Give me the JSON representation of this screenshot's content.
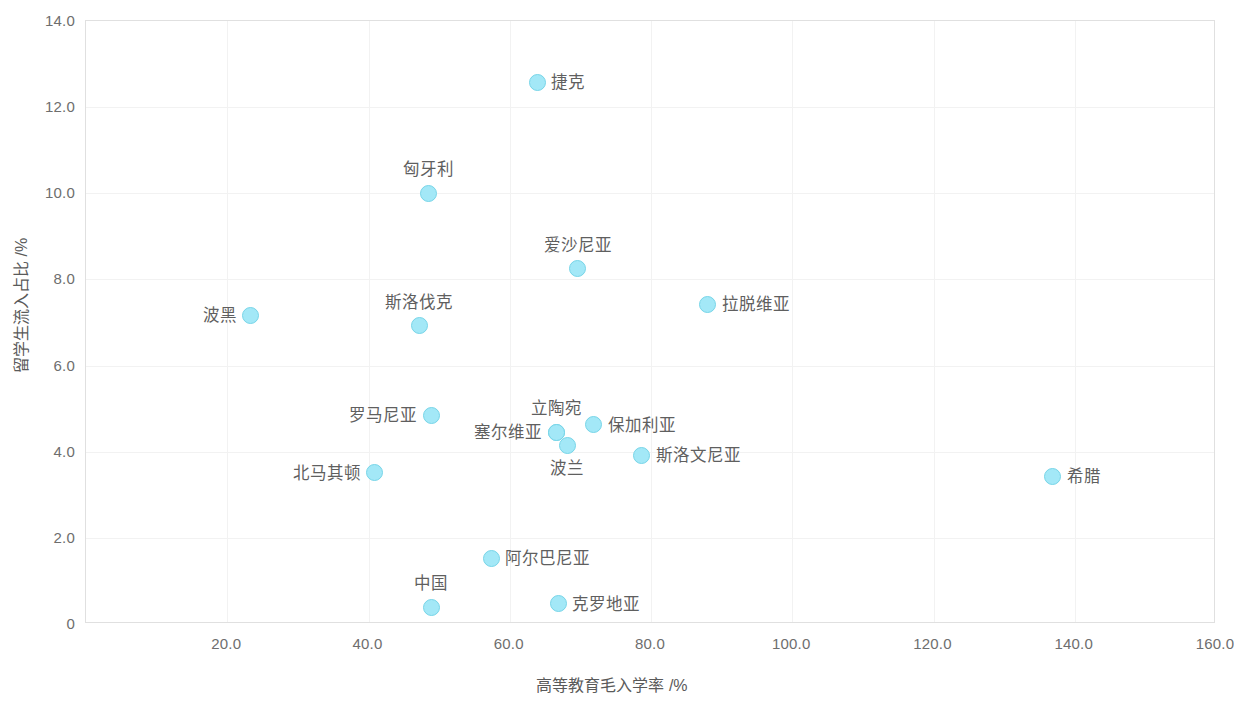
{
  "chart_data": {
    "type": "scatter",
    "title": "",
    "xlabel": "高等教育毛入学率 /%",
    "ylabel": "留学生流入占比 /%",
    "xlim": [
      0,
      160
    ],
    "ylim": [
      0,
      14
    ],
    "xticks": [
      "20.0",
      "40.0",
      "60.0",
      "80.0",
      "100.0",
      "120.0",
      "140.0",
      "160.0"
    ],
    "xtick_values": [
      20,
      40,
      60,
      80,
      100,
      120,
      140,
      160
    ],
    "yticks": [
      "0",
      "2.0",
      "4.0",
      "6.0",
      "8.0",
      "10.0",
      "12.0",
      "14.0"
    ],
    "ytick_values": [
      0,
      2,
      4,
      6,
      8,
      10,
      12,
      14
    ],
    "grid": true,
    "legend": "none",
    "marker_color": "#a3e8f7",
    "marker_edge_color": "#77d5e8",
    "points": [
      {
        "label": "捷克",
        "x": 64.0,
        "y": 12.55,
        "label_pos": "right"
      },
      {
        "label": "匈牙利",
        "x": 48.7,
        "y": 9.98,
        "label_pos": "above"
      },
      {
        "label": "爱沙尼亚",
        "x": 69.8,
        "y": 8.22,
        "label_pos": "above"
      },
      {
        "label": "拉脱维亚",
        "x": 88.2,
        "y": 7.4,
        "label_pos": "right"
      },
      {
        "label": "波黑",
        "x": 23.5,
        "y": 7.14,
        "label_pos": "left"
      },
      {
        "label": "斯洛伐克",
        "x": 47.3,
        "y": 6.9,
        "label_pos": "above"
      },
      {
        "label": "罗马尼亚",
        "x": 49.0,
        "y": 4.82,
        "label_pos": "left"
      },
      {
        "label": "立陶宛",
        "x": 66.7,
        "y": 4.43,
        "label_pos": "above"
      },
      {
        "label": "保加利亚",
        "x": 72.0,
        "y": 4.6,
        "label_pos": "right"
      },
      {
        "label": "波兰",
        "x": 68.3,
        "y": 4.12,
        "label_pos": "below"
      },
      {
        "label": "塞尔维亚",
        "x": 66.7,
        "y": 4.43,
        "label_pos": "left"
      },
      {
        "label": "斯洛文尼亚",
        "x": 78.8,
        "y": 3.9,
        "label_pos": "right"
      },
      {
        "label": "北马其顿",
        "x": 41.0,
        "y": 3.49,
        "label_pos": "left"
      },
      {
        "label": "希腊",
        "x": 137.0,
        "y": 3.41,
        "label_pos": "right"
      },
      {
        "label": "阿尔巴尼亚",
        "x": 57.5,
        "y": 1.5,
        "label_pos": "right"
      },
      {
        "label": "克罗地亚",
        "x": 67.0,
        "y": 0.45,
        "label_pos": "right"
      },
      {
        "label": "中国",
        "x": 49.0,
        "y": 0.37,
        "label_pos": "above"
      }
    ]
  }
}
